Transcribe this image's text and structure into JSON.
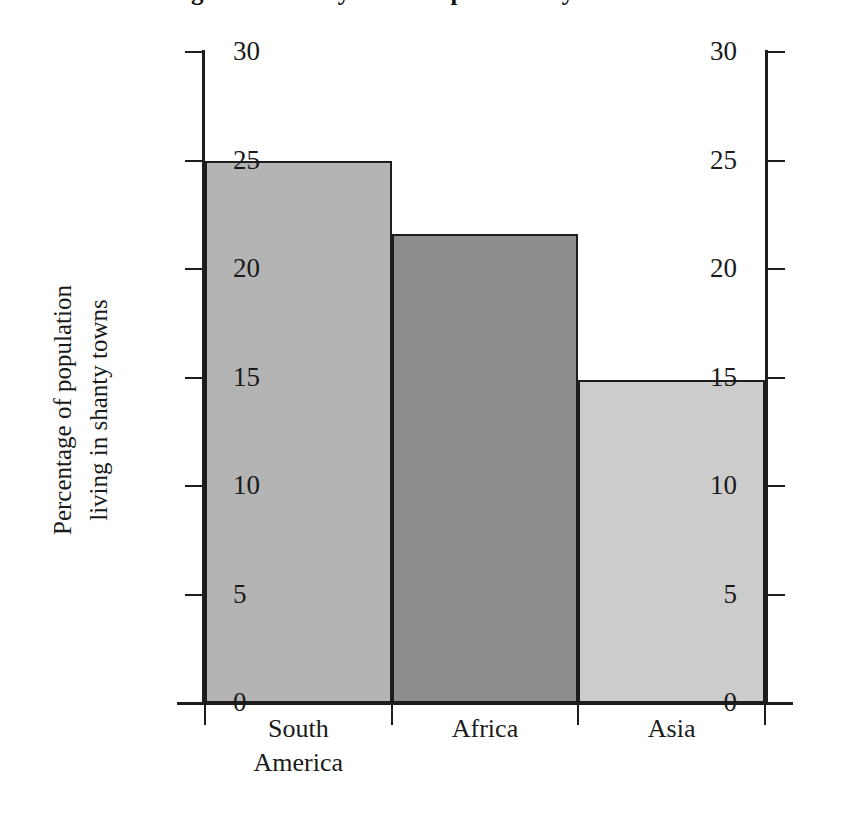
{
  "chart_data": {
    "type": "bar",
    "title": "Figure 2: Shanty Town Population by Continent",
    "categories": [
      "South America",
      "Africa",
      "Asia"
    ],
    "category_lines": [
      [
        "South",
        "America"
      ],
      [
        "Africa"
      ],
      [
        "Asia"
      ]
    ],
    "values": [
      25.0,
      21.6,
      14.9
    ],
    "series": [
      {
        "name": "Percentage of population living in shanty towns",
        "values": [
          25.0,
          21.6,
          14.9
        ]
      }
    ],
    "xlabel": "",
    "ylabel": "Percentage of population living in shanty towns",
    "ylabel_lines": [
      "Percentage of population",
      "living in shanty towns"
    ],
    "ylim": [
      0,
      30
    ],
    "yticks": [
      0,
      5,
      10,
      15,
      20,
      25,
      30
    ],
    "ytick_labels": [
      "0",
      "5",
      "10",
      "15",
      "20",
      "25",
      "30"
    ],
    "right_axis": {
      "enabled": true,
      "ylim": [
        0,
        30
      ],
      "yticks": [
        0,
        5,
        10,
        15,
        20,
        25,
        30
      ],
      "ytick_labels": [
        "0",
        "5",
        "10",
        "15",
        "20",
        "25",
        "30"
      ]
    },
    "grid": false,
    "legend": false,
    "bar_colors": [
      "#b4b4b4",
      "#8d8d8d",
      "#cccccc"
    ],
    "bar_edge_color": "#1d1d1d",
    "axis_color": "#1d1d1d",
    "background": "#ffffff"
  }
}
